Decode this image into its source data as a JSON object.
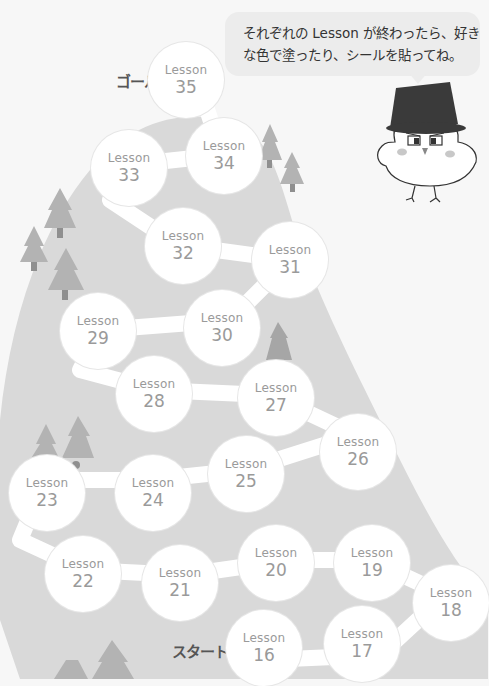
{
  "instruction": {
    "line1": "それぞれの Lesson が終わったら、好き",
    "line2": "な色で塗ったり、シールを貼ってね。",
    "furigana": [
      "お",
      "す",
      "いろ",
      "ぬ",
      "は"
    ]
  },
  "markers": {
    "goal": "ゴール",
    "start": "スタート"
  },
  "lesson_label": "Lesson",
  "lessons": [
    {
      "label": "Lesson",
      "number": "35"
    },
    {
      "label": "Lesson",
      "number": "34"
    },
    {
      "label": "Lesson",
      "number": "33"
    },
    {
      "label": "Lesson",
      "number": "32"
    },
    {
      "label": "Lesson",
      "number": "31"
    },
    {
      "label": "Lesson",
      "number": "30"
    },
    {
      "label": "Lesson",
      "number": "29"
    },
    {
      "label": "Lesson",
      "number": "28"
    },
    {
      "label": "Lesson",
      "number": "27"
    },
    {
      "label": "Lesson",
      "number": "26"
    },
    {
      "label": "Lesson",
      "number": "25"
    },
    {
      "label": "Lesson",
      "number": "24"
    },
    {
      "label": "Lesson",
      "number": "23"
    },
    {
      "label": "Lesson",
      "number": "22"
    },
    {
      "label": "Lesson",
      "number": "21"
    },
    {
      "label": "Lesson",
      "number": "20"
    },
    {
      "label": "Lesson",
      "number": "19"
    },
    {
      "label": "Lesson",
      "number": "18"
    },
    {
      "label": "Lesson",
      "number": "17"
    },
    {
      "label": "Lesson",
      "number": "16"
    }
  ],
  "colors": {
    "background": "#f7f7f7",
    "mountain": "#d9d9d9",
    "trees": "#b3b3b3",
    "path": "#ffffff",
    "bubble": "#ececec",
    "lesson_text": "#9a9a9a",
    "hat": "#3a3a3a"
  },
  "mascot": "bird-with-top-hat"
}
